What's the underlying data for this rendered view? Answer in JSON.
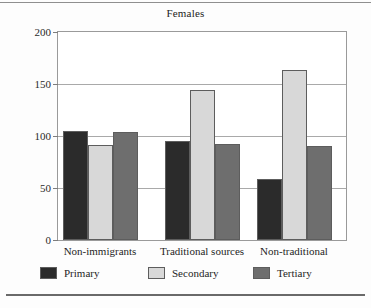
{
  "chart_data": {
    "type": "bar",
    "title": "Females",
    "xlabel": "",
    "ylabel": "",
    "ylim": [
      0,
      200
    ],
    "yticks": [
      0,
      50,
      100,
      150,
      200
    ],
    "grid": true,
    "gridlines": [
      50,
      100,
      150
    ],
    "legend_position": "bottom",
    "categories": [
      "Non-immigrants",
      "Traditional sources",
      "Non-traditional"
    ],
    "series": [
      {
        "name": "Primary",
        "color": "#2b2b2b",
        "values": [
          105,
          95,
          59
        ]
      },
      {
        "name": "Secondary",
        "color": "#d8d8d8",
        "values": [
          91,
          144,
          163
        ]
      },
      {
        "name": "Tertiary",
        "color": "#6e6e6e",
        "values": [
          104,
          92,
          90
        ]
      }
    ]
  },
  "legend": {
    "items": [
      {
        "label": "Primary"
      },
      {
        "label": "Secondary"
      },
      {
        "label": "Tertiary"
      }
    ]
  }
}
